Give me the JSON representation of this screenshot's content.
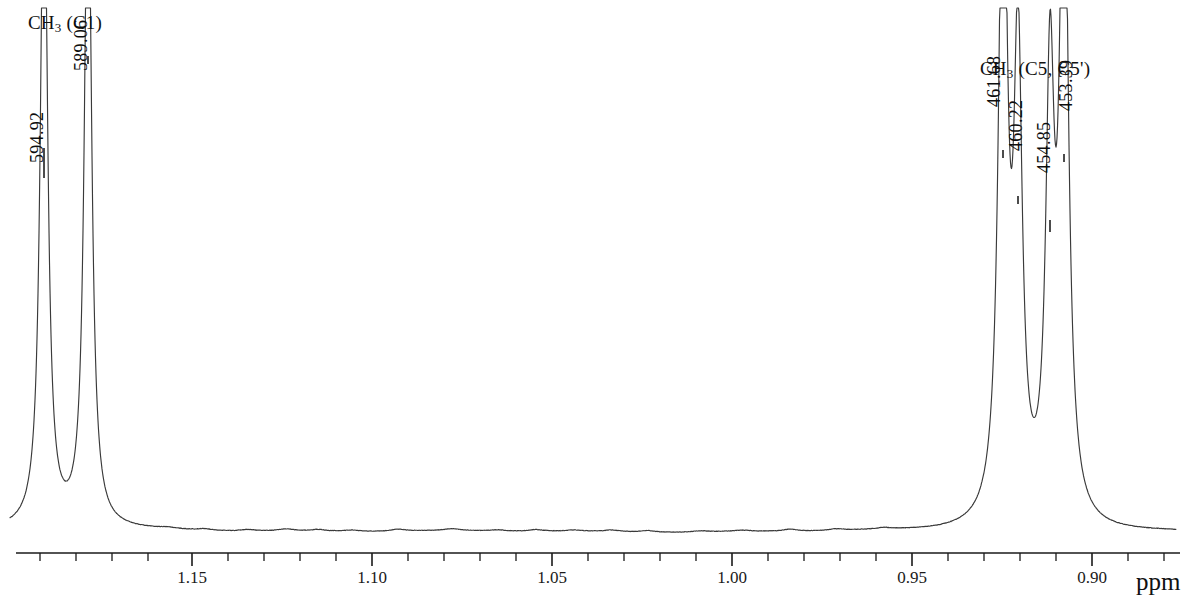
{
  "figure": {
    "kind": "nmr-spectrum",
    "trace_color": "#3a3a3a",
    "axis_color": "#1a1a1a",
    "background": "#ffffff"
  },
  "assignments": [
    {
      "id": "ch3-c1",
      "prefix": "CH",
      "sub": "3",
      "suffix": " (C1)",
      "x": 28,
      "y": 12
    },
    {
      "id": "ch3-c5-c5prime",
      "prefix": "CH",
      "sub": "3",
      "suffix": " (C5, C5')",
      "x": 980,
      "y": 58
    }
  ],
  "peak_labels": [
    {
      "id": "peak-594-92",
      "text": "594.92",
      "x": 48,
      "y": 142,
      "leader_x": 44,
      "leader_y1": 148,
      "leader_y2": 178
    },
    {
      "id": "peak-589-06",
      "text": "589.06",
      "x": 92,
      "y": 50,
      "leader_x": 88,
      "leader_y1": 56,
      "leader_y2": 64
    },
    {
      "id": "peak-461-68",
      "text": "461.68",
      "x": 1005,
      "y": 86,
      "leader_x": 1003,
      "leader_y1": 150,
      "leader_y2": 158
    },
    {
      "id": "peak-460-22",
      "text": "460.22",
      "x": 1027,
      "y": 130,
      "leader_x": 1018,
      "leader_y1": 196,
      "leader_y2": 204
    },
    {
      "id": "peak-454-85",
      "text": "454.85",
      "x": 1055,
      "y": 152,
      "leader_x": 1050,
      "leader_y1": 220,
      "leader_y2": 232
    },
    {
      "id": "peak-453-39",
      "text": "453.39",
      "x": 1077,
      "y": 90,
      "leader_x": 1064,
      "leader_y1": 154,
      "leader_y2": 162
    }
  ],
  "axis": {
    "unit": "ppm",
    "unit_x": 1136,
    "unit_y": 568,
    "line_y": 553,
    "x_start": 16,
    "x_end": 1180,
    "ppm_at_x_start": 1.1755,
    "ppm_at_x_end": 0.8785,
    "major_tick_length": 13,
    "minor_tick_length": 8,
    "major_ticks": [
      {
        "value": "1.15",
        "x": 192
      },
      {
        "value": "1.10",
        "x": 372
      },
      {
        "value": "1.05",
        "x": 552
      },
      {
        "value": "1.00",
        "x": 732
      },
      {
        "value": "0.95",
        "x": 912
      },
      {
        "value": "0.90",
        "x": 1092
      }
    ],
    "minor_tick_xs": [
      40,
      76,
      112,
      148,
      228,
      264,
      300,
      336,
      408,
      444,
      480,
      516,
      588,
      624,
      660,
      696,
      768,
      804,
      840,
      876,
      948,
      984,
      1020,
      1056,
      1128,
      1164
    ]
  },
  "chart_data": {
    "type": "line",
    "title": "",
    "subtitle": "",
    "xlabel": "ppm",
    "ylabel": "",
    "xlim": [
      1.1755,
      0.8785
    ],
    "x_axis_inverted": true,
    "grid": false,
    "legend": "none",
    "annotations": [
      "CH3 (C1)",
      "CH3 (C5, C5')"
    ],
    "peaks": [
      {
        "label": "594.92",
        "group": "CH3 (C1)",
        "ppm": 1.1305,
        "pixel_x": 44,
        "relative_height": 1.0,
        "clipped": true
      },
      {
        "label": "589.06",
        "group": "CH3 (C1)",
        "ppm": 1.1195,
        "pixel_x": 88,
        "relative_height": 1.0,
        "clipped": true
      },
      {
        "label": "461.68",
        "group": "CH3 (C5, C5')",
        "ppm": 0.9075,
        "pixel_x": 1003,
        "relative_height": 1.0,
        "clipped": true
      },
      {
        "label": "460.22",
        "group": "CH3 (C5, C5')",
        "ppm": 0.9045,
        "pixel_x": 1018,
        "relative_height": 0.88,
        "clipped": false
      },
      {
        "label": "454.85",
        "group": "CH3 (C5, C5')",
        "ppm": 0.8955,
        "pixel_x": 1050,
        "relative_height": 0.82,
        "clipped": false
      },
      {
        "label": "453.39",
        "group": "CH3 (C5, C5')",
        "ppm": 0.8925,
        "pixel_x": 1064,
        "relative_height": 1.0,
        "clipped": true
      }
    ],
    "baseline_pixel_y": 531,
    "tick_labels": [
      "1.15",
      "1.10",
      "1.05",
      "1.00",
      "0.95",
      "0.90"
    ]
  }
}
